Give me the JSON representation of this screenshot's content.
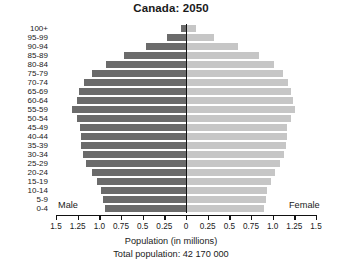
{
  "chart_data": {
    "type": "bar",
    "subtype": "population-pyramid",
    "title": "Canada: 2050",
    "xlabel": "Population (in millions)",
    "ylabel": "",
    "total_population_label": "Total population: 42 170 000",
    "total_population": 42170000,
    "xlim": [
      -1.5,
      1.5
    ],
    "xtick_labels": [
      "1.5",
      "1.25",
      "1.0",
      "0.75",
      "0.5",
      "0.25",
      "0",
      "0.25",
      "0.5",
      "0.75",
      "1.0",
      "1.25",
      "1.5"
    ],
    "xtick_values": [
      1.5,
      1.25,
      1.0,
      0.75,
      0.5,
      0.25,
      0,
      0.25,
      0.5,
      0.75,
      1.0,
      1.25,
      1.5
    ],
    "grid": false,
    "legend_position": "inside-bottom",
    "categories": [
      "0-4",
      "5-9",
      "10-14",
      "15-19",
      "20-24",
      "25-29",
      "30-34",
      "35-39",
      "40-44",
      "45-49",
      "50-54",
      "55-59",
      "60-64",
      "65-69",
      "70-74",
      "75-79",
      "80-84",
      "85-89",
      "90-94",
      "95-99",
      "100+"
    ],
    "series": [
      {
        "name": "Male",
        "color": "#6b6b6b",
        "side": "left",
        "values": [
          0.94,
          0.96,
          0.98,
          1.03,
          1.08,
          1.15,
          1.19,
          1.21,
          1.21,
          1.22,
          1.26,
          1.31,
          1.26,
          1.23,
          1.18,
          1.08,
          0.92,
          0.71,
          0.46,
          0.22,
          0.06
        ]
      },
      {
        "name": "Female",
        "color": "#c6c6c6",
        "side": "right",
        "values": [
          0.9,
          0.92,
          0.94,
          0.98,
          1.03,
          1.09,
          1.13,
          1.15,
          1.16,
          1.17,
          1.21,
          1.26,
          1.23,
          1.21,
          1.18,
          1.12,
          1.01,
          0.84,
          0.6,
          0.32,
          0.11
        ]
      }
    ]
  },
  "legend": {
    "male_label": "Male",
    "female_label": "Female"
  }
}
